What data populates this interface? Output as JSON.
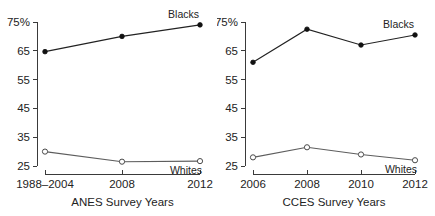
{
  "figure": {
    "background": "#ffffff",
    "ink": "#222222"
  },
  "chart_data": [
    {
      "type": "line",
      "title": "",
      "panel_id": "anes",
      "xlabel": "ANES Survey Years",
      "ylabel": "",
      "categories": [
        "1988–2004",
        "2008",
        "2012"
      ],
      "ylim": [
        25,
        75
      ],
      "yticks": [
        25,
        35,
        45,
        55,
        65,
        75
      ],
      "ytick_labels": [
        "25",
        "35",
        "45",
        "55",
        "65",
        "75%"
      ],
      "grid": false,
      "legend_position": "inline-end-of-line",
      "series": [
        {
          "name": "Blacks",
          "marker": "filled-circle",
          "values": [
            64.7,
            70.0,
            74.0
          ]
        },
        {
          "name": "Whites",
          "marker": "open-circle",
          "values": [
            30.0,
            26.5,
            26.7
          ]
        }
      ]
    },
    {
      "type": "line",
      "title": "",
      "panel_id": "cces",
      "xlabel": "CCES Survey Years",
      "ylabel": "",
      "categories": [
        "2006",
        "2008",
        "2010",
        "2012"
      ],
      "ylim": [
        25,
        75
      ],
      "yticks": [
        25,
        35,
        45,
        55,
        65,
        75
      ],
      "ytick_labels": [
        "25",
        "35",
        "45",
        "55",
        "65",
        "75%"
      ],
      "grid": false,
      "legend_position": "inline-end-of-line",
      "series": [
        {
          "name": "Blacks",
          "marker": "filled-circle",
          "values": [
            61.0,
            72.5,
            67.0,
            70.5
          ]
        },
        {
          "name": "Whites",
          "marker": "open-circle",
          "values": [
            28.0,
            31.5,
            29.0,
            27.0
          ]
        }
      ]
    }
  ],
  "panels": {
    "left": {
      "axis_title": "ANES Survey Years",
      "ytick_labels": [
        "75%",
        "65",
        "55",
        "45",
        "35",
        "25"
      ],
      "xtick_labels": [
        "1988–2004",
        "2008",
        "2012"
      ],
      "label_blacks": "Blacks",
      "label_whites": "Whites"
    },
    "right": {
      "axis_title": "CCES Survey Years",
      "ytick_labels": [
        "75%",
        "65",
        "55",
        "45",
        "35",
        "25"
      ],
      "xtick_labels": [
        "2006",
        "2008",
        "2010",
        "2012"
      ],
      "label_blacks": "Blacks",
      "label_whites": "Whites"
    }
  }
}
